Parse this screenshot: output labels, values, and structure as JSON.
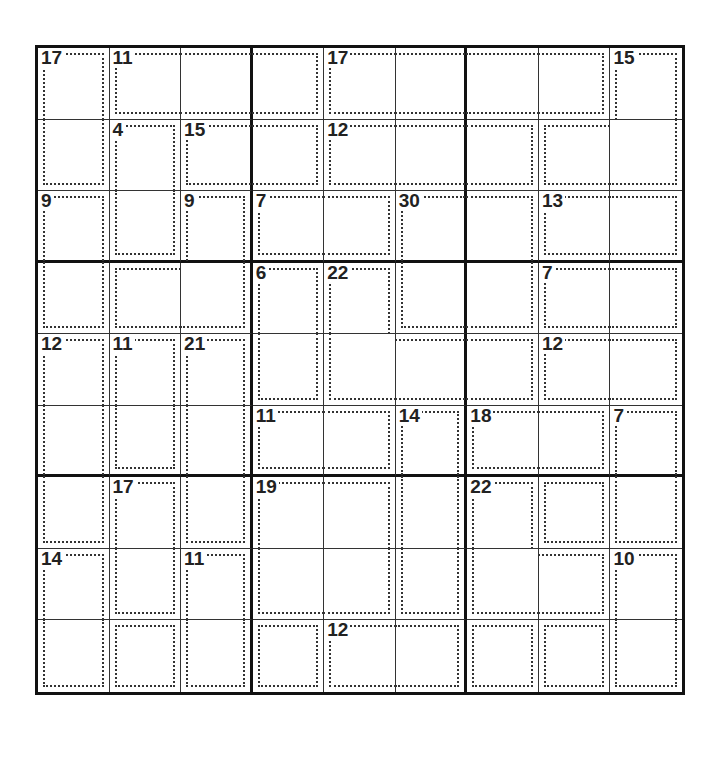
{
  "puzzle": {
    "type": "killer-sudoku",
    "size": 9,
    "cages": [
      [
        "a",
        "b",
        "b",
        "b",
        "c",
        "c",
        "c",
        "c",
        "d"
      ],
      [
        "a",
        "e",
        "f",
        "f",
        "g",
        "g",
        "g",
        "d",
        "d"
      ],
      [
        "h",
        "e",
        "i",
        "j",
        "j",
        "k",
        "k",
        "l",
        "l"
      ],
      [
        "h",
        "i",
        "i",
        "m",
        "n",
        "k",
        "k",
        "o",
        "o"
      ],
      [
        "p",
        "q",
        "r",
        "m",
        "n",
        "n",
        "n",
        "s",
        "s"
      ],
      [
        "p",
        "q",
        "r",
        "t",
        "t",
        "u",
        "v",
        "v",
        "w"
      ],
      [
        "p",
        "x",
        "r",
        "y",
        "y",
        "u",
        "z",
        "z2",
        "w"
      ],
      [
        "A",
        "x",
        "B",
        "y",
        "y",
        "u",
        "z",
        "z",
        "C"
      ],
      [
        "A",
        "A2",
        "B",
        "D",
        "E",
        "E",
        "E2",
        "C2",
        "C"
      ]
    ],
    "clues": [
      {
        "r": 0,
        "c": 0,
        "v": "17"
      },
      {
        "r": 0,
        "c": 1,
        "v": "11"
      },
      {
        "r": 0,
        "c": 4,
        "v": "17"
      },
      {
        "r": 0,
        "c": 8,
        "v": "15"
      },
      {
        "r": 1,
        "c": 1,
        "v": "4"
      },
      {
        "r": 1,
        "c": 2,
        "v": "15"
      },
      {
        "r": 1,
        "c": 4,
        "v": "12"
      },
      {
        "r": 2,
        "c": 0,
        "v": "9"
      },
      {
        "r": 2,
        "c": 2,
        "v": "9"
      },
      {
        "r": 2,
        "c": 3,
        "v": "7"
      },
      {
        "r": 2,
        "c": 5,
        "v": "30"
      },
      {
        "r": 2,
        "c": 7,
        "v": "13"
      },
      {
        "r": 3,
        "c": 3,
        "v": "6"
      },
      {
        "r": 3,
        "c": 4,
        "v": "22"
      },
      {
        "r": 3,
        "c": 7,
        "v": "7"
      },
      {
        "r": 4,
        "c": 0,
        "v": "12"
      },
      {
        "r": 4,
        "c": 1,
        "v": "11"
      },
      {
        "r": 4,
        "c": 2,
        "v": "21"
      },
      {
        "r": 4,
        "c": 7,
        "v": "12"
      },
      {
        "r": 5,
        "c": 3,
        "v": "11"
      },
      {
        "r": 5,
        "c": 5,
        "v": "14"
      },
      {
        "r": 5,
        "c": 6,
        "v": "18"
      },
      {
        "r": 5,
        "c": 8,
        "v": "7"
      },
      {
        "r": 6,
        "c": 1,
        "v": "17"
      },
      {
        "r": 6,
        "c": 3,
        "v": "19"
      },
      {
        "r": 6,
        "c": 6,
        "v": "22"
      },
      {
        "r": 7,
        "c": 0,
        "v": "14"
      },
      {
        "r": 7,
        "c": 2,
        "v": "11"
      },
      {
        "r": 7,
        "c": 8,
        "v": "10"
      },
      {
        "r": 8,
        "c": 4,
        "v": "12"
      }
    ]
  }
}
